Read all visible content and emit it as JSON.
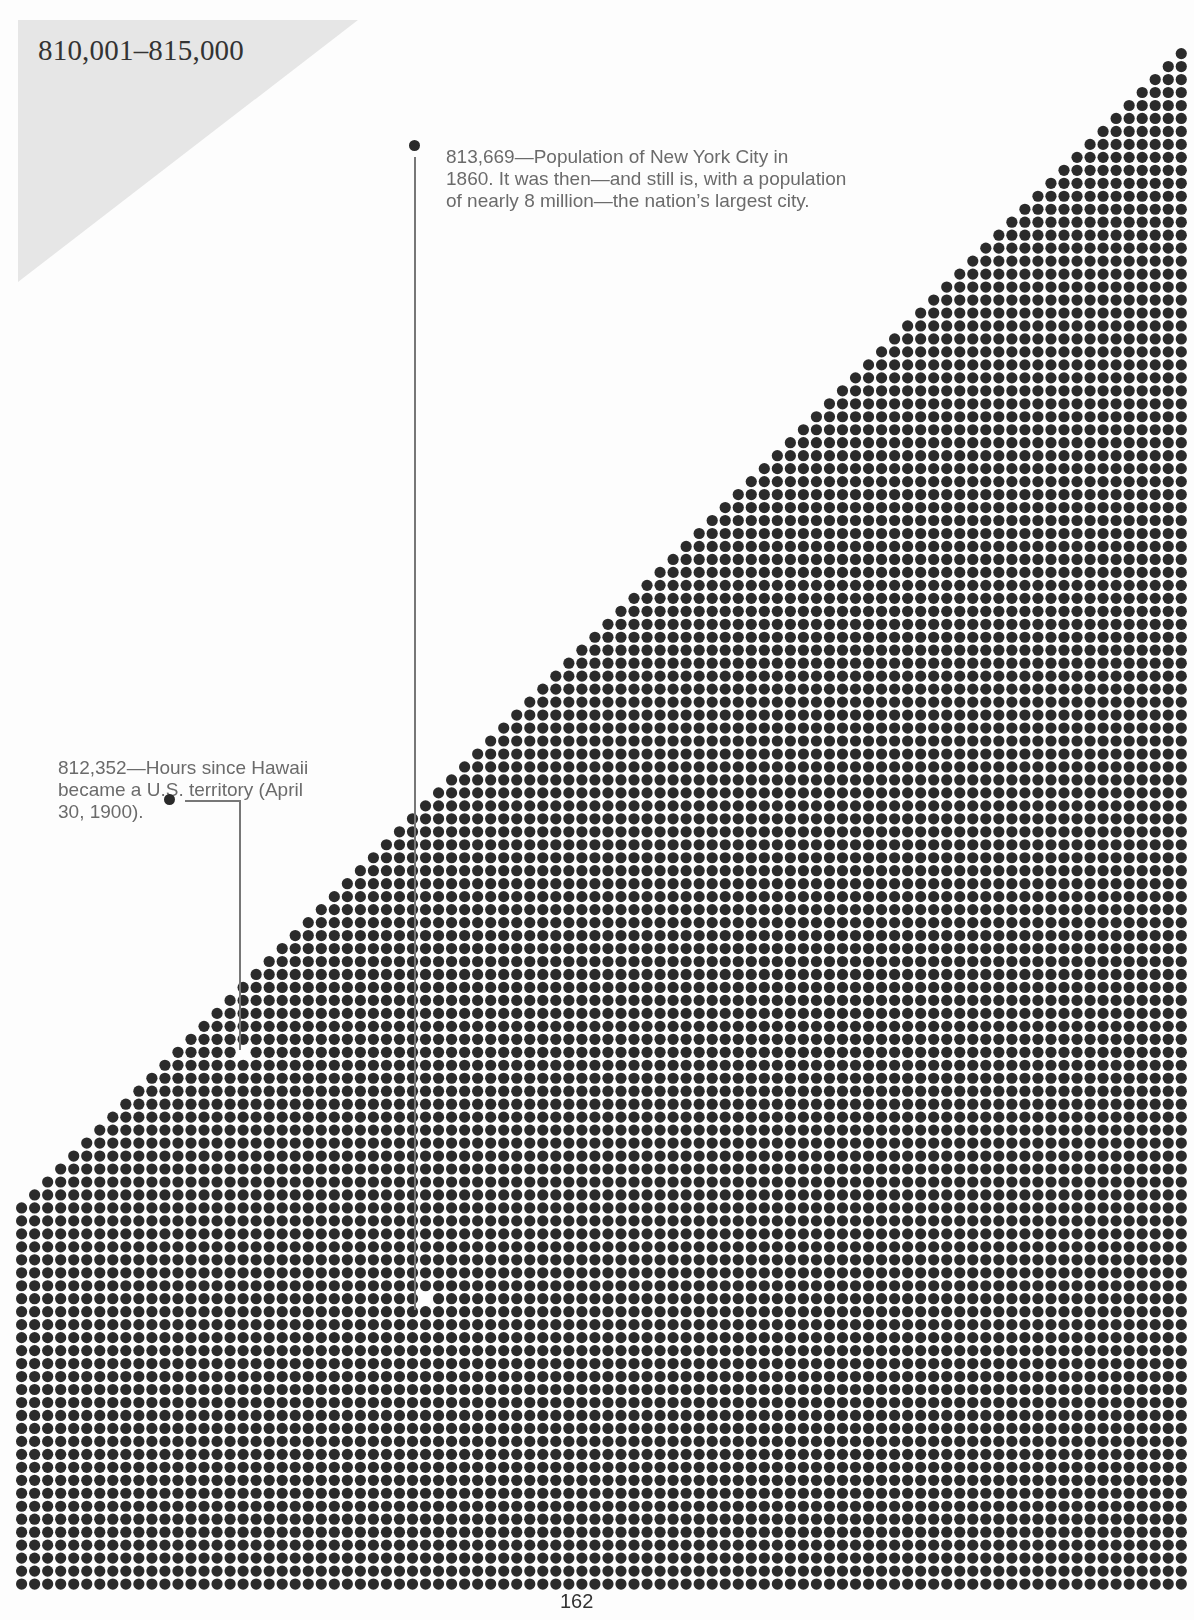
{
  "header": {
    "range_title": "810,001–815,000",
    "range_bg_color": "#e6e6e6"
  },
  "annotations": [
    {
      "id": "nyc",
      "number": "813,669",
      "lines": [
        "813,669—Population of New York City in",
        "1860. It was then—and still is, with a population",
        "of nearly 8 million—the nation’s largest city."
      ]
    },
    {
      "id": "hawaii",
      "number": "812,352",
      "lines": [
        "812,352—Hours since Hawaii",
        "became a U.S. territory (April",
        "30, 1900)."
      ]
    }
  ],
  "dot_grid": {
    "dot_color": "#2b2b2b",
    "origin_x": 16,
    "origin_y": 48,
    "pitch_x": 13.03,
    "pitch_y": 12.97,
    "cols": 90,
    "rows": 119,
    "dot_diameter": 11.2,
    "staircase_rows": 89,
    "gaps": [
      {
        "col": 31,
        "row": 96
      },
      {
        "col": 17,
        "row": 77
      }
    ]
  },
  "footer": {
    "page_number": "162"
  }
}
